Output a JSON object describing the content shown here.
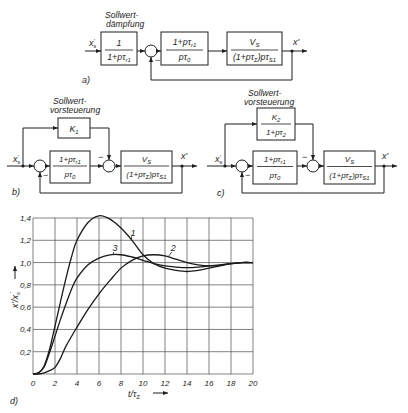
{
  "panel_a": {
    "label": "a)",
    "caption": [
      "Sollwert-",
      "dämpfung"
    ],
    "input_label": {
      "base": "x",
      "prime": "'",
      "sub": "s"
    },
    "output_label": "x'",
    "filter_block": {
      "num": "1",
      "den": "1+pτ",
      "den_sub": "r1"
    },
    "controller_block": {
      "num": "1+pτ",
      "num_sub": "r1",
      "den": "pτ",
      "den_sub": "0"
    },
    "plant_block": {
      "num": "V",
      "num_sub": "S",
      "den_a": "(1+pτ",
      "den_sub_a": "Σ",
      "den_b": ")pτ",
      "den_sub_b": "S1"
    },
    "sum_sign": "−"
  },
  "panel_b": {
    "label": "b)",
    "caption": [
      "Sollwert-",
      "vorsteuerung"
    ],
    "input_label": {
      "base": "x",
      "prime": "'",
      "sub": "s"
    },
    "output_label": "x'",
    "feedforward_block": {
      "num": "K",
      "num_sub": "1"
    },
    "controller_block": {
      "num": "1+pτ",
      "num_sub": "r1",
      "den": "pτ",
      "den_sub": "0"
    },
    "plant_block": {
      "num": "V",
      "num_sub": "S",
      "den_a": "(1+pτ",
      "den_sub_a": "Σ",
      "den_b": ")pτ",
      "den_sub_b": "S1"
    },
    "sum_sign": "−"
  },
  "panel_c": {
    "label": "c)",
    "caption": [
      "Sollwert-",
      "vorsteuerung"
    ],
    "input_label": {
      "base": "x",
      "prime": "'",
      "sub": "s"
    },
    "output_label": "x'",
    "feedforward_block": {
      "num": "K",
      "num_sub": "2",
      "den": "1+pτ",
      "den_sub": "2"
    },
    "controller_block": {
      "num": "1+pτ",
      "num_sub": "r1",
      "den": "pτ",
      "den_sub": "0"
    },
    "plant_block": {
      "num": "V",
      "num_sub": "S",
      "den_a": "(1+pτ",
      "den_sub_a": "Σ",
      "den_b": ")pτ",
      "den_sub_b": "S1"
    },
    "sum_sign": "−"
  },
  "panel_d": {
    "label": "d)",
    "ylabel": {
      "a": "x'/x",
      "sub": "s",
      "prime": "'"
    },
    "xlabel": {
      "a": "t/τ",
      "sub": "Σ"
    }
  },
  "chart_data": {
    "type": "line",
    "title": "",
    "xlabel": "t/τΣ",
    "ylabel": "x'/x's",
    "xlim": [
      0,
      20
    ],
    "ylim": [
      0,
      1.4
    ],
    "grid": true,
    "legend": null,
    "xticks": [
      0,
      2,
      4,
      6,
      8,
      10,
      12,
      14,
      16,
      18,
      20
    ],
    "xticklabels": [
      "0",
      "2",
      "4",
      "6",
      "8",
      "10",
      "12",
      "14",
      "16",
      "18",
      "20"
    ],
    "yticks": [
      0.2,
      0.4,
      0.6,
      0.8,
      1.0,
      1.2,
      1.4
    ],
    "yticklabels": [
      "0,2",
      "0,4",
      "0,6",
      "0,8",
      "1,0",
      "1,2",
      "1,4"
    ],
    "series": [
      {
        "name": "1",
        "x": [
          0,
          0.5,
          1,
          1.5,
          2,
          2.5,
          3,
          3.5,
          4,
          5,
          6,
          7,
          8,
          9,
          10,
          11,
          12,
          13,
          14,
          15,
          16,
          17,
          18,
          19,
          20
        ],
        "y": [
          0,
          0.01,
          0.07,
          0.22,
          0.43,
          0.65,
          0.86,
          1.05,
          1.2,
          1.36,
          1.42,
          1.39,
          1.31,
          1.2,
          1.07,
          0.99,
          0.95,
          0.93,
          0.92,
          0.93,
          0.95,
          0.97,
          0.99,
          1.0,
          1.0
        ]
      },
      {
        "name": "2",
        "x": [
          0,
          0.5,
          1,
          1.5,
          2,
          2.5,
          3,
          4,
          5,
          6,
          7,
          8,
          9,
          10,
          11,
          12,
          13,
          14,
          15,
          16,
          17,
          18,
          19,
          20
        ],
        "y": [
          0,
          0.0,
          0.01,
          0.03,
          0.06,
          0.14,
          0.25,
          0.42,
          0.58,
          0.72,
          0.84,
          0.95,
          1.02,
          1.06,
          1.07,
          1.06,
          1.03,
          1.0,
          0.98,
          0.97,
          0.975,
          0.99,
          1.0,
          1.0
        ]
      },
      {
        "name": "3",
        "x": [
          0,
          0.5,
          1,
          1.5,
          2,
          2.5,
          3,
          3.5,
          4,
          5,
          6,
          7,
          8,
          9,
          10,
          11,
          12,
          13,
          14,
          15,
          16,
          17,
          18,
          19,
          20
        ],
        "y": [
          0,
          0.01,
          0.06,
          0.19,
          0.34,
          0.49,
          0.63,
          0.76,
          0.86,
          0.98,
          1.04,
          1.07,
          1.07,
          1.05,
          1.02,
          0.99,
          0.97,
          0.96,
          0.955,
          0.96,
          0.97,
          0.98,
          0.99,
          1.0,
          1.0
        ]
      }
    ],
    "annotations": [
      {
        "text": "1",
        "xy": [
          9.1,
          1.24
        ],
        "leader_to": [
          8.95,
          1.2
        ]
      },
      {
        "text": "2",
        "xy": [
          12.75,
          1.1
        ],
        "leader_to": [
          12.35,
          1.06
        ]
      },
      {
        "text": "3",
        "xy": [
          7.45,
          1.1
        ],
        "leader_to": [
          7.3,
          1.075
        ]
      }
    ]
  }
}
